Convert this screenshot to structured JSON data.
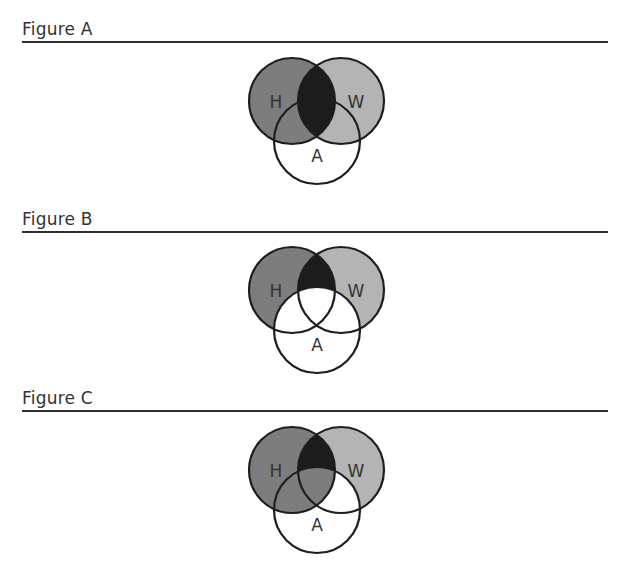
{
  "colors": {
    "h_fill": "#7d7d7d",
    "w_fill": "#b4b4b4",
    "overlap_fill": "#1c1c1c",
    "a_fill": "#ffffff",
    "stroke": "#1e1e1e"
  },
  "figures": [
    {
      "title": "Figure A",
      "circle_labels": {
        "h": "H",
        "w": "W",
        "a": "A"
      },
      "shading": {
        "h_only": "h_fill",
        "w_only": "w_fill",
        "a_only": "a_fill",
        "h_and_w_not_a": "overlap_fill",
        "h_and_a_not_w": "h_fill",
        "w_and_a_not_h": "w_fill",
        "h_and_w_and_a": "overlap_fill"
      }
    },
    {
      "title": "Figure B",
      "circle_labels": {
        "h": "H",
        "w": "W",
        "a": "A"
      },
      "shading": {
        "h_only": "h_fill",
        "w_only": "w_fill",
        "a_only": "a_fill",
        "h_and_w_not_a": "overlap_fill",
        "h_and_a_not_w": "a_fill",
        "w_and_a_not_h": "a_fill",
        "h_and_w_and_a": "a_fill"
      }
    },
    {
      "title": "Figure C",
      "circle_labels": {
        "h": "H",
        "w": "W",
        "a": "A"
      },
      "shading": {
        "h_only": "h_fill",
        "w_only": "w_fill",
        "a_only": "a_fill",
        "h_and_w_not_a": "overlap_fill",
        "h_and_a_not_w": "h_fill",
        "w_and_a_not_h": "a_fill",
        "h_and_w_and_a": "h_fill"
      }
    }
  ]
}
